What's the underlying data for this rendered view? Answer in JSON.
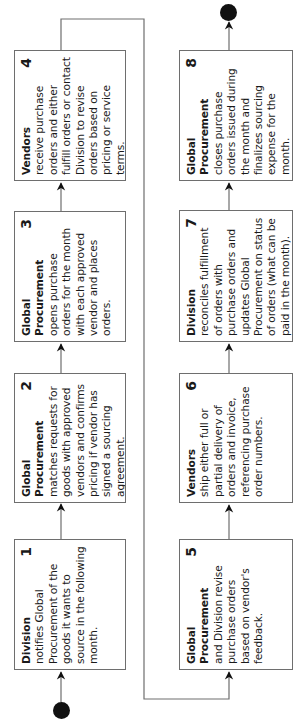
{
  "diagram": {
    "type": "process-flow",
    "orientation": "rotated-90-ccw",
    "colors": {
      "line": "#6e6e6e",
      "border": "#6e6e6e",
      "terminal": "#111111",
      "text": "#1a1a1a"
    },
    "steps": [
      {
        "number": "1",
        "actor": "Division",
        "description": "notifies Global Procurement of the goods it wants to source in the following month."
      },
      {
        "number": "2",
        "actor": "Global Procurement",
        "description": "matches requests for goods with approved vendors and confirms pricing if vendor has signed a sourcing agreement."
      },
      {
        "number": "3",
        "actor": "Global Procurement",
        "description": "opens purchase orders for the month with each approved vendor and places orders."
      },
      {
        "number": "4",
        "actor": "Vendors",
        "description": "receive purchase orders and either fulfill orders or contact Division to revise orders based on pricing or service terms."
      },
      {
        "number": "5",
        "actor": "Global Procurement",
        "description": "and Division revise purchase orders based on vendor's feedback."
      },
      {
        "number": "6",
        "actor": "Vendors",
        "description": "ship either full or partial delivery of orders and invoice, referencing purchase order numbers."
      },
      {
        "number": "7",
        "actor": "Division",
        "description": "reconciles fulfillment of orders with purchase orders and updates Global Procurement on status of orders (what can be paid in the month)."
      },
      {
        "number": "8",
        "actor": "Global Procurement",
        "description": "closes purchase orders issued during the month and finalizes sourcing expense for the month."
      }
    ],
    "flow": [
      "start",
      "1",
      "2",
      "3",
      "4",
      "5",
      "6",
      "7",
      "8",
      "end"
    ]
  }
}
